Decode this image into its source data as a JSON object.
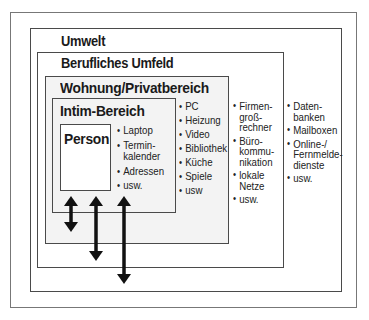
{
  "diagram": {
    "levels": [
      {
        "id": "umwelt",
        "title": "Umwelt"
      },
      {
        "id": "beruf",
        "title": "Berufliches Umfeld"
      },
      {
        "id": "wohnung",
        "title": "Wohnung/Privatbereich"
      },
      {
        "id": "intim",
        "title": "Intim-Bereich"
      },
      {
        "id": "person",
        "title": "Person"
      }
    ],
    "lists": {
      "intim": [
        "Laptop",
        "Termin-\nkalender",
        "Adressen",
        "usw."
      ],
      "wohnung": [
        "PC",
        "Heizung",
        "Video",
        "Bibliothek",
        "Küche",
        "Spiele",
        "usw"
      ],
      "beruf": [
        "Firmen-\ngroß-\nrechner",
        "Büro-\nkommu-\nnikation",
        "lokale\nNetze",
        "usw."
      ],
      "umwelt": [
        "Daten-\nbanken",
        "Mailboxen",
        "Online-/\nFernmelde-\ndienste",
        "usw."
      ]
    },
    "arrows": [
      {
        "from": "person",
        "to": "wohnung",
        "icon": "double-arrow-icon"
      },
      {
        "from": "person",
        "to": "beruf",
        "icon": "double-arrow-icon"
      },
      {
        "from": "person",
        "to": "umwelt",
        "icon": "double-arrow-icon"
      }
    ],
    "colors": {
      "border": "#4a4a4a",
      "fill_inner": "#f3f3f3",
      "arrow": "#111111"
    }
  }
}
